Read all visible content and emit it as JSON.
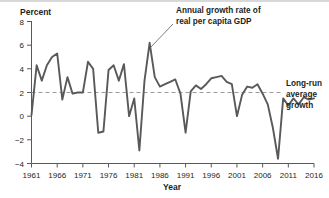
{
  "chart_data": {
    "type": "line",
    "title": "",
    "xlabel": "Year",
    "ylabel": "Percent",
    "xlim": [
      1961,
      2016
    ],
    "ylim": [
      -4,
      8
    ],
    "grid": false,
    "legend_position": "annotation",
    "xticks": [
      "1961",
      "1966",
      "1971",
      "1976",
      "1981",
      "1986",
      "1991",
      "1996",
      "2001",
      "2006",
      "2011",
      "2016"
    ],
    "xtick_values": [
      1961,
      1966,
      1971,
      1976,
      1981,
      1986,
      1991,
      1996,
      2001,
      2006,
      2011,
      2016
    ],
    "yticks": [
      "8",
      "6",
      "4",
      "2",
      "0",
      "−2",
      "−4"
    ],
    "ytick_values": [
      8,
      6,
      4,
      2,
      0,
      -2,
      -4
    ],
    "series": [
      {
        "name": "Annual growth rate of real per capita GDP",
        "color": "#59595b",
        "x": [
          1961,
          1962,
          1963,
          1964,
          1965,
          1966,
          1967,
          1968,
          1969,
          1970,
          1971,
          1972,
          1973,
          1974,
          1975,
          1976,
          1977,
          1978,
          1979,
          1980,
          1981,
          1982,
          1983,
          1984,
          1985,
          1986,
          1987,
          1988,
          1989,
          1990,
          1991,
          1992,
          1993,
          1994,
          1995,
          1996,
          1997,
          1998,
          1999,
          2000,
          2001,
          2002,
          2003,
          2004,
          2005,
          2006,
          2007,
          2008,
          2009,
          2010,
          2011,
          2012,
          2013,
          2014,
          2015,
          2016
        ],
        "values": [
          0.1,
          4.3,
          3.0,
          4.3,
          5.0,
          5.3,
          1.4,
          3.3,
          1.9,
          2.0,
          2.0,
          4.6,
          4.0,
          -1.4,
          -1.3,
          3.9,
          4.3,
          3.0,
          4.4,
          0.0,
          1.5,
          -2.9,
          3.0,
          6.2,
          3.3,
          2.5,
          2.7,
          2.9,
          3.1,
          1.9,
          -1.4,
          2.1,
          2.6,
          2.3,
          2.7,
          3.2,
          3.3,
          3.4,
          2.9,
          2.7,
          0.0,
          1.8,
          2.5,
          2.4,
          2.7,
          1.9,
          1.0,
          -1.0,
          -3.6,
          1.5,
          0.9,
          1.5,
          1.0,
          1.6,
          1.4,
          1.5
        ]
      }
    ],
    "reference_line": {
      "name": "Long-run average growth",
      "value": 2,
      "style": "dashed",
      "color": "#9a9a9a"
    },
    "annotations": [
      {
        "name": "series-annotation",
        "lines": [
          "Annual growth rate of",
          "real per capita GDP"
        ],
        "points_to_year": 1984
      },
      {
        "name": "reference-line-annotation",
        "lines": [
          "Long-run",
          "average",
          "growth"
        ]
      }
    ]
  },
  "labels": {
    "y_axis_title": "Percent",
    "x_axis_title": "Year",
    "annotation_line1": "Annual growth rate of",
    "annotation_line2": "real per capita GDP",
    "side_line1": "Long-run",
    "side_line2": "average",
    "side_line3": "growth"
  }
}
